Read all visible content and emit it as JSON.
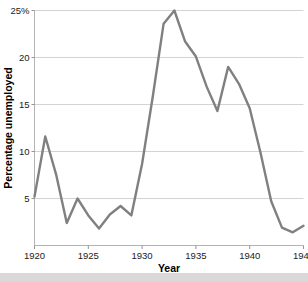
{
  "chart_data": {
    "type": "line",
    "title": "",
    "xlabel": "Year",
    "ylabel": "Percentage unemployed",
    "xlim": [
      1920,
      1945
    ],
    "ylim": [
      0,
      25
    ],
    "grid": true,
    "legend": false,
    "line_color": "#808080",
    "x": [
      1920,
      1921,
      1922,
      1923,
      1924,
      1925,
      1926,
      1927,
      1928,
      1929,
      1930,
      1931,
      1932,
      1933,
      1934,
      1935,
      1936,
      1937,
      1938,
      1939,
      1940,
      1941,
      1942,
      1943,
      1944,
      1945
    ],
    "values": [
      5.2,
      11.6,
      7.6,
      2.4,
      5.0,
      3.2,
      1.8,
      3.3,
      4.2,
      3.2,
      8.7,
      15.9,
      23.6,
      25.0,
      21.7,
      20.1,
      16.9,
      14.3,
      19.0,
      17.2,
      14.6,
      9.9,
      4.7,
      1.9,
      1.4,
      2.1
    ],
    "yticks": [
      5,
      10,
      15,
      20,
      25
    ],
    "ytick_labels": [
      "5",
      "10",
      "15",
      "20",
      "25%"
    ],
    "xticks": [
      1920,
      1925,
      1930,
      1935,
      1940,
      1945
    ],
    "xtick_labels": [
      "1920",
      "1925",
      "1930",
      "1935",
      "1940",
      "1945"
    ]
  }
}
